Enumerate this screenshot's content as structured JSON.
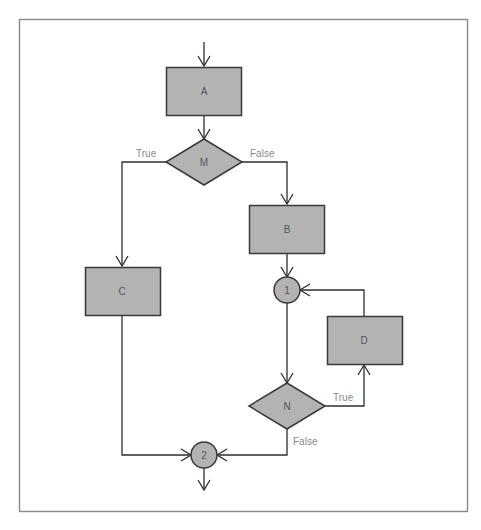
{
  "diagram": {
    "type": "flowchart",
    "nodes": {
      "A": {
        "label": "A",
        "shape": "rectangle"
      },
      "M": {
        "label": "M",
        "shape": "diamond"
      },
      "B": {
        "label": "B",
        "shape": "rectangle"
      },
      "C": {
        "label": "C",
        "shape": "rectangle"
      },
      "J1": {
        "label": "1",
        "shape": "circle"
      },
      "D": {
        "label": "D",
        "shape": "rectangle"
      },
      "N": {
        "label": "N",
        "shape": "diamond"
      },
      "J2": {
        "label": "2",
        "shape": "circle"
      }
    },
    "edges": [
      {
        "from": "start",
        "to": "A",
        "label": ""
      },
      {
        "from": "A",
        "to": "M",
        "label": ""
      },
      {
        "from": "M",
        "to": "C",
        "label": "True"
      },
      {
        "from": "M",
        "to": "B",
        "label": "False"
      },
      {
        "from": "B",
        "to": "J1",
        "label": ""
      },
      {
        "from": "J1",
        "to": "N",
        "label": ""
      },
      {
        "from": "N",
        "to": "D",
        "label": "True"
      },
      {
        "from": "D",
        "to": "J1",
        "label": ""
      },
      {
        "from": "N",
        "to": "J2",
        "label": "False"
      },
      {
        "from": "C",
        "to": "J2",
        "label": ""
      },
      {
        "from": "J2",
        "to": "end",
        "label": ""
      }
    ],
    "edge_labels": {
      "m_true": "True",
      "m_false": "False",
      "n_true": "True",
      "n_false": "False"
    },
    "colors": {
      "node_fill": "#b3b3b3",
      "node_stroke": "#3a3a3a",
      "edge": "#2e2e2e",
      "frame": "#8a8a8a",
      "label_text": "#555555",
      "edge_label_text": "#8a8a8a"
    }
  }
}
